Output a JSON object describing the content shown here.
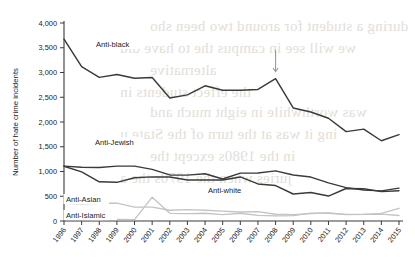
{
  "chart_data": {
    "type": "line",
    "title": "",
    "xlabel": "",
    "ylabel": "Number of hate crime incidents",
    "xlim": [
      1996,
      2015
    ],
    "ylim": [
      0,
      4000
    ],
    "ytick_labels": [
      "0",
      "500",
      "1,000",
      "1,500",
      "2,000",
      "2,500",
      "3,000",
      "3,500",
      "4,000"
    ],
    "ytick_values": [
      0,
      500,
      1000,
      1500,
      2000,
      2500,
      3000,
      3500,
      4000
    ],
    "grid": false,
    "legend": "inline-labels",
    "categories": [
      1996,
      1997,
      1998,
      1999,
      2000,
      2001,
      2002,
      2003,
      2004,
      2005,
      2006,
      2007,
      2008,
      2009,
      2010,
      2011,
      2012,
      2013,
      2014,
      2015
    ],
    "xtick_labels": [
      "1996",
      "1997",
      "1998",
      "1999",
      "2000",
      "2001",
      "2002",
      "2003",
      "2004",
      "2005",
      "2006",
      "2007",
      "2008",
      "2009",
      "2010",
      "2011",
      "2012",
      "2013",
      "2014",
      "2015"
    ],
    "series": [
      {
        "name": "Anti-black",
        "color": "#3a3a3a",
        "values": [
          3674,
          3120,
          2901,
          2958,
          2884,
          2899,
          2486,
          2548,
          2731,
          2640,
          2640,
          2658,
          2876,
          2284,
          2201,
          2076,
          1805,
          1856,
          1621,
          1745
        ]
      },
      {
        "name": "Anti-Jewish",
        "color": "#3a3a3a",
        "values": [
          1109,
          1087,
          1081,
          1109,
          1109,
          1043,
          931,
          927,
          954,
          848,
          967,
          969,
          1013,
          931,
          887,
          771,
          674,
          625,
          609,
          664
        ]
      },
      {
        "name": "Anti-white",
        "color": "#3a3a3a",
        "values": [
          1106,
          993,
          792,
          781,
          875,
          891,
          888,
          830,
          829,
          828,
          890,
          749,
          716,
          545,
          575,
          504,
          657,
          653,
          593,
          613
        ]
      },
      {
        "name": "Anti-Asian",
        "color": "#c4c4c4",
        "values": [
          355,
          347,
          359,
          360,
          281,
          280,
          217,
          231,
          217,
          199,
          181,
          188,
          137,
          126,
          150,
          165,
          135,
          135,
          140,
          111
        ]
      },
      {
        "name": "Anti-Islamic",
        "color": "#c4c4c4",
        "values": [
          27,
          28,
          21,
          32,
          28,
          481,
          155,
          149,
          156,
          128,
          156,
          115,
          105,
          107,
          160,
          157,
          130,
          135,
          154,
          257
        ]
      }
    ],
    "series_labels": [
      {
        "name": "Anti-black",
        "text": "Anti-black"
      },
      {
        "name": "Anti-Jewish",
        "text": "Anti-Jewish"
      },
      {
        "name": "Anti-white",
        "text": "Anti-white"
      },
      {
        "name": "Anti-Asian",
        "text": "Anti-Asian"
      },
      {
        "name": "Anti-Islamic",
        "text": "Anti-Islamic"
      }
    ],
    "annotations": [
      {
        "type": "arrow",
        "points_to_year": 2008,
        "points_to_series": "Anti-black",
        "color": "#9a9a9a"
      }
    ]
  },
  "background_bleed": {
    "lines": [
      "during a student for around two been sho",
      "we will see in campus the to have did",
      "alternative",
      "the effect students in",
      "was worthwhile in eight much and",
      "ing it was at the turn of the State u",
      "in the 1980s except the",
      "juries when the 1970s the a"
    ]
  }
}
